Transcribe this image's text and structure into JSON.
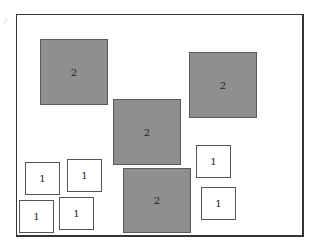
{
  "diagram": {
    "corner_mark": "/",
    "large_boxes": [
      {
        "label": "2",
        "x": 40,
        "y": 39,
        "w": 68,
        "h": 66
      },
      {
        "label": "2",
        "x": 189,
        "y": 52,
        "w": 68,
        "h": 66
      },
      {
        "label": "2",
        "x": 113,
        "y": 99,
        "w": 68,
        "h": 66
      },
      {
        "label": "2",
        "x": 123,
        "y": 168,
        "w": 68,
        "h": 65
      }
    ],
    "small_boxes": [
      {
        "label": "1",
        "x": 25,
        "y": 162,
        "w": 35,
        "h": 33
      },
      {
        "label": "1",
        "x": 67,
        "y": 159,
        "w": 35,
        "h": 33
      },
      {
        "label": "1",
        "x": 19,
        "y": 200,
        "w": 35,
        "h": 33
      },
      {
        "label": "1",
        "x": 59,
        "y": 197,
        "w": 35,
        "h": 33
      },
      {
        "label": "1",
        "x": 196,
        "y": 145,
        "w": 35,
        "h": 33
      },
      {
        "label": "1",
        "x": 201,
        "y": 187,
        "w": 35,
        "h": 33
      }
    ],
    "colors": {
      "large_fill": "#8f8f8f",
      "small_fill": "#ffffff",
      "border": "#333333"
    }
  }
}
